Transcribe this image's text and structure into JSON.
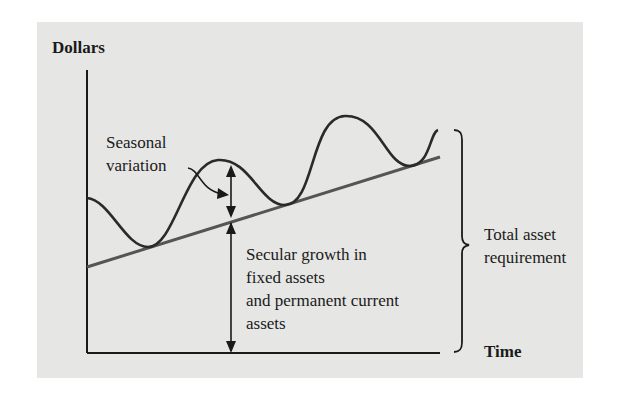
{
  "figure": {
    "y_axis_label": "Dollars",
    "x_axis_label": "Time",
    "annotations": {
      "seasonal": [
        "Seasonal",
        "variation"
      ],
      "secular": [
        "Secular growth in",
        "fixed assets",
        "and permanent current",
        "assets"
      ],
      "total": [
        "Total asset",
        "requirement"
      ]
    },
    "colors": {
      "background": "#e6e6e4",
      "curve": "#2a2a2a",
      "trend_line": "#555555",
      "axes": "#1a1a1a"
    }
  }
}
